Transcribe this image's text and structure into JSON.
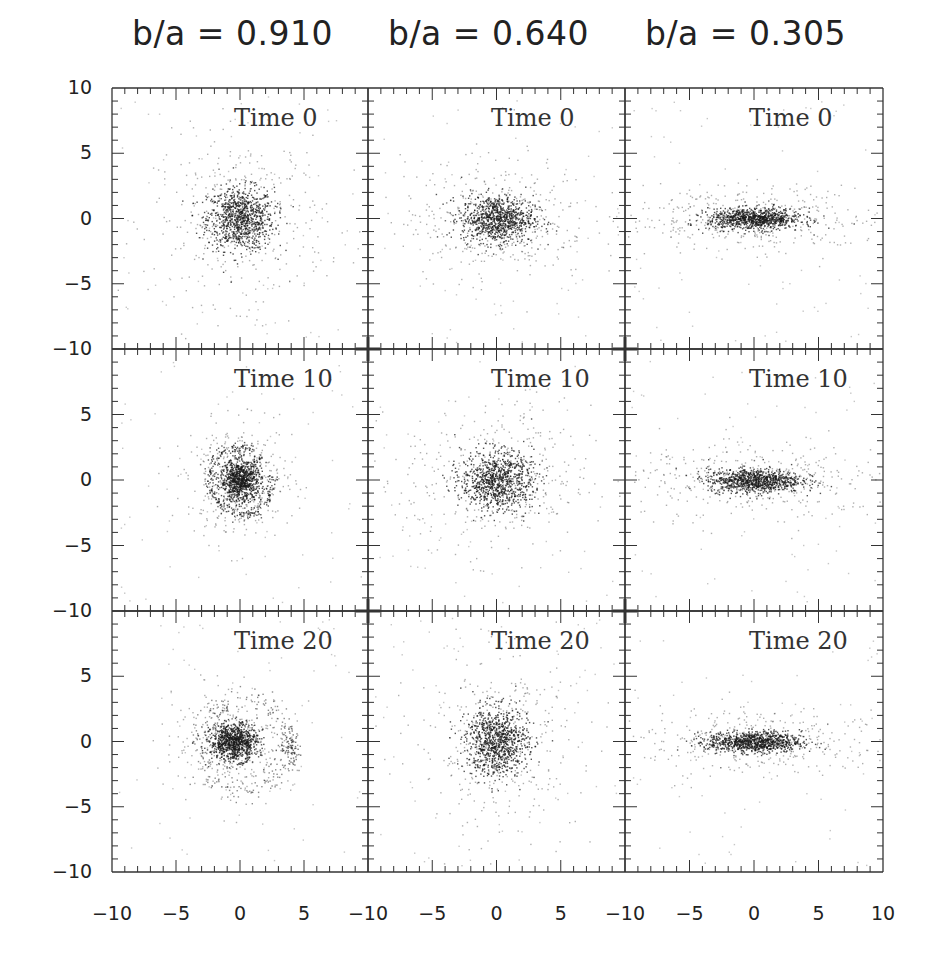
{
  "chart_data": {
    "type": "scatter",
    "layout": "3x3 grid of panels, shared axes",
    "columns": [
      {
        "title": "b/a = 0.910",
        "axis_ratio": 0.91
      },
      {
        "title": "b/a = 0.640",
        "axis_ratio": 0.64
      },
      {
        "title": "b/a = 0.305",
        "axis_ratio": 0.305
      }
    ],
    "rows": [
      {
        "label": "Time 0",
        "time": 0
      },
      {
        "label": "Time 10",
        "time": 10
      },
      {
        "label": "Time 20",
        "time": 20
      }
    ],
    "xlim": [
      -10,
      10
    ],
    "ylim": [
      -10,
      10
    ],
    "x_tick_labels": [
      "-10",
      "-5",
      "0",
      "5",
      "-10",
      "-5",
      "0",
      "5",
      "-10",
      "-5",
      "0",
      "5",
      "10"
    ],
    "y_tick_labels": [
      "10",
      "5",
      "0",
      "-5",
      "-10",
      "5",
      "0",
      "-5",
      "-10",
      "5",
      "0",
      "-5",
      "-10"
    ],
    "xlabel": "",
    "ylabel": "",
    "grid": false,
    "legend": null,
    "panels": [
      {
        "row": 0,
        "col": 0,
        "label": "Time 0",
        "description": "compact nearly round particle cluster centered at (0,0), core radius ~1.5, halo to ~5",
        "center": [
          0,
          0
        ],
        "sx": 1.3,
        "sy": 1.2,
        "features": "round"
      },
      {
        "row": 0,
        "col": 1,
        "label": "Time 0",
        "description": "slightly elongated cluster centered at (0,0)",
        "center": [
          0,
          0
        ],
        "sx": 1.4,
        "sy": 0.9,
        "features": "ellipse"
      },
      {
        "row": 0,
        "col": 2,
        "label": "Time 0",
        "description": "highly flattened bar-like cluster along x axis",
        "center": [
          0,
          0
        ],
        "sx": 1.8,
        "sy": 0.4,
        "features": "bar"
      },
      {
        "row": 1,
        "col": 0,
        "label": "Time 10",
        "description": "tilted bar with ring/spiral arms of radius ~3",
        "center": [
          0,
          0
        ],
        "sx": 0.8,
        "sy": 0.8,
        "features": "ring"
      },
      {
        "row": 1,
        "col": 1,
        "label": "Time 10",
        "description": "diffuse cluster centered at (0,0) with broad halo",
        "center": [
          0,
          0
        ],
        "sx": 1.4,
        "sy": 1.1,
        "features": "ellipse"
      },
      {
        "row": 1,
        "col": 2,
        "label": "Time 10",
        "description": "flattened bar along x axis",
        "center": [
          0,
          0
        ],
        "sx": 1.8,
        "sy": 0.45,
        "features": "bar"
      },
      {
        "row": 2,
        "col": 0,
        "label": "Time 20",
        "description": "core offset to (-0.5,0) with disrupted shell/arc structures out to ~4",
        "center": [
          -0.5,
          0
        ],
        "sx": 0.9,
        "sy": 0.7,
        "features": "shells"
      },
      {
        "row": 2,
        "col": 1,
        "label": "Time 20",
        "description": "diffuse cluster slightly vertical elongation",
        "center": [
          0,
          0
        ],
        "sx": 1.2,
        "sy": 1.3,
        "features": "ellipse"
      },
      {
        "row": 2,
        "col": 2,
        "label": "Time 20",
        "description": "flattened bar along x axis",
        "center": [
          0,
          0
        ],
        "sx": 1.8,
        "sy": 0.4,
        "features": "bar"
      }
    ]
  },
  "colors": {
    "ink": "#1a1a1a",
    "frame": "#333333",
    "background": "#ffffff"
  }
}
